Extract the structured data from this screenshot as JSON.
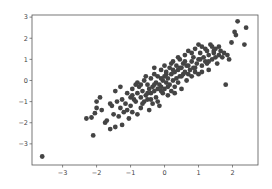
{
  "chart_data": {
    "type": "scatter",
    "title": "",
    "xlabel": "",
    "ylabel": "",
    "xlim": [
      -3.9,
      2.75
    ],
    "ylim": [
      -4.0,
      3.1
    ],
    "x_ticks": [
      -3,
      -2,
      -1,
      0,
      1,
      2
    ],
    "x_tick_labels": [
      "−3",
      "−2",
      "−1",
      "0",
      "1",
      "2"
    ],
    "y_ticks": [
      3,
      2,
      1,
      0,
      -1,
      -2,
      -3
    ],
    "y_tick_labels": [
      "3",
      "2",
      "1",
      "0",
      "−1",
      "−2",
      "−3"
    ],
    "grid": false,
    "legend": null,
    "marker_color": "#444444",
    "marker_radius": 2.4,
    "series": [
      {
        "name": "points",
        "points": [
          [
            -3.6,
            -3.6
          ],
          [
            -2.3,
            -1.8
          ],
          [
            -2.15,
            -1.75
          ],
          [
            -2.05,
            -1.55
          ],
          [
            -2.0,
            -1.3
          ],
          [
            -2.0,
            -1.0
          ],
          [
            -2.1,
            -2.6
          ],
          [
            -1.85,
            -1.4
          ],
          [
            -1.75,
            -2.0
          ],
          [
            -1.7,
            -1.9
          ],
          [
            -1.6,
            -2.3
          ],
          [
            -1.55,
            -1.2
          ],
          [
            -1.5,
            -1.6
          ],
          [
            -1.45,
            -2.2
          ],
          [
            -1.4,
            -1.0
          ],
          [
            -1.35,
            -1.7
          ],
          [
            -1.3,
            -0.3
          ],
          [
            -1.3,
            -1.3
          ],
          [
            -1.25,
            -0.9
          ],
          [
            -1.2,
            -1.5
          ],
          [
            -1.15,
            -1.1
          ],
          [
            -1.1,
            -0.6
          ],
          [
            -1.05,
            -1.8
          ],
          [
            -1.0,
            -0.8
          ],
          [
            -1.0,
            -1.2
          ],
          [
            -0.95,
            -0.4
          ],
          [
            -0.95,
            -1.5
          ],
          [
            -0.9,
            -0.9
          ],
          [
            -0.85,
            -0.2
          ],
          [
            -0.85,
            -1.0
          ],
          [
            -0.8,
            -0.6
          ],
          [
            -0.8,
            -1.6
          ],
          [
            -0.75,
            -0.3
          ],
          [
            -0.7,
            -0.8
          ],
          [
            -0.7,
            -1.3
          ],
          [
            -0.65,
            -0.5
          ],
          [
            -0.6,
            0.0
          ],
          [
            -0.6,
            -1.0
          ],
          [
            -0.55,
            -0.7
          ],
          [
            -0.5,
            -0.2
          ],
          [
            -0.5,
            -0.9
          ],
          [
            -0.45,
            -0.4
          ],
          [
            -0.45,
            -1.4
          ],
          [
            -0.4,
            0.1
          ],
          [
            -0.4,
            -0.6
          ],
          [
            -0.35,
            -0.3
          ],
          [
            -0.35,
            -1.1
          ],
          [
            -0.3,
            0.3
          ],
          [
            -0.3,
            -0.5
          ],
          [
            -0.25,
            -0.1
          ],
          [
            -0.25,
            -0.8
          ],
          [
            -0.2,
            0.2
          ],
          [
            -0.2,
            -0.4
          ],
          [
            -0.15,
            -0.2
          ],
          [
            -0.15,
            -1.2
          ],
          [
            -0.1,
            0.5
          ],
          [
            -0.1,
            -0.3
          ],
          [
            -0.05,
            0.0
          ],
          [
            -0.05,
            -0.6
          ],
          [
            0.0,
            0.2
          ],
          [
            0.0,
            -0.4
          ],
          [
            0.05,
            0.4
          ],
          [
            0.05,
            -0.1
          ],
          [
            0.1,
            0.1
          ],
          [
            0.1,
            -0.7
          ],
          [
            0.15,
            0.6
          ],
          [
            0.15,
            -0.2
          ],
          [
            0.2,
            0.3
          ],
          [
            0.2,
            -0.5
          ],
          [
            0.25,
            0.9
          ],
          [
            0.25,
            0.0
          ],
          [
            0.3,
            0.4
          ],
          [
            0.3,
            -0.3
          ],
          [
            0.35,
            0.7
          ],
          [
            0.35,
            0.1
          ],
          [
            0.4,
            0.5
          ],
          [
            0.4,
            -0.1
          ],
          [
            0.45,
            1.0
          ],
          [
            0.45,
            0.2
          ],
          [
            0.5,
            0.6
          ],
          [
            0.5,
            -0.4
          ],
          [
            0.55,
            0.8
          ],
          [
            0.55,
            0.3
          ],
          [
            0.6,
            1.2
          ],
          [
            0.6,
            0.4
          ],
          [
            0.65,
            0.0
          ],
          [
            0.7,
            0.7
          ],
          [
            0.7,
            1.4
          ],
          [
            0.75,
            0.5
          ],
          [
            0.8,
            0.9
          ],
          [
            0.8,
            0.2
          ],
          [
            0.85,
            1.1
          ],
          [
            0.9,
            0.6
          ],
          [
            0.9,
            1.5
          ],
          [
            0.95,
            0.8
          ],
          [
            1.0,
            1.0
          ],
          [
            1.0,
            0.3
          ],
          [
            1.05,
            1.3
          ],
          [
            1.1,
            0.7
          ],
          [
            1.1,
            1.6
          ],
          [
            1.15,
            1.1
          ],
          [
            1.2,
            0.9
          ],
          [
            1.25,
            1.4
          ],
          [
            1.3,
            1.2
          ],
          [
            1.3,
            0.5
          ],
          [
            1.35,
            1.7
          ],
          [
            1.4,
            1.0
          ],
          [
            1.45,
            1.3
          ],
          [
            1.5,
            1.5
          ],
          [
            1.55,
            0.8
          ],
          [
            1.6,
            1.2
          ],
          [
            1.65,
            1.4
          ],
          [
            1.7,
            1.1
          ],
          [
            1.75,
            1.3
          ],
          [
            1.8,
            -0.2
          ],
          [
            1.85,
            1.2
          ],
          [
            1.9,
            1.0
          ],
          [
            1.97,
            1.8
          ],
          [
            2.06,
            2.3
          ],
          [
            2.1,
            2.15
          ],
          [
            2.15,
            2.8
          ],
          [
            2.35,
            1.7
          ],
          [
            2.4,
            2.5
          ],
          [
            -1.9,
            -0.8
          ],
          [
            -1.6,
            -1.1
          ],
          [
            -1.45,
            -0.5
          ],
          [
            -1.25,
            -2.1
          ],
          [
            -1.1,
            -1.4
          ],
          [
            -0.95,
            -0.7
          ],
          [
            -0.8,
            -0.1
          ],
          [
            -0.65,
            -1.1
          ],
          [
            -0.55,
            0.2
          ],
          [
            -0.4,
            -0.9
          ],
          [
            -0.3,
            0.6
          ],
          [
            -0.2,
            -1.0
          ],
          [
            -0.1,
            0.1
          ],
          [
            0.0,
            0.7
          ],
          [
            0.1,
            -0.3
          ],
          [
            0.2,
            0.8
          ],
          [
            0.3,
            -0.6
          ],
          [
            0.4,
            1.1
          ],
          [
            0.5,
            0.2
          ],
          [
            0.6,
            0.9
          ],
          [
            0.7,
            0.3
          ],
          [
            0.8,
            1.3
          ],
          [
            0.9,
            0.4
          ],
          [
            1.0,
            1.7
          ],
          [
            1.1,
            0.4
          ],
          [
            1.2,
            1.5
          ],
          [
            1.3,
            0.9
          ],
          [
            1.4,
            1.6
          ],
          [
            1.5,
            1.1
          ],
          [
            1.6,
            1.6
          ],
          [
            -0.7,
            -0.2
          ],
          [
            -0.5,
            -0.6
          ],
          [
            -0.3,
            -0.2
          ],
          [
            -0.1,
            -0.5
          ],
          [
            0.05,
            0.3
          ],
          [
            0.25,
            0.5
          ],
          [
            0.45,
            0.6
          ],
          [
            0.65,
            0.7
          ],
          [
            0.85,
            0.6
          ],
          [
            1.05,
            1.0
          ],
          [
            1.25,
            0.8
          ],
          [
            1.45,
            1.4
          ]
        ]
      }
    ]
  }
}
